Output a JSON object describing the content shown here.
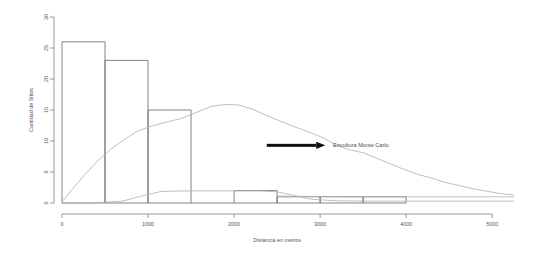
{
  "chart_data": {
    "type": "bar",
    "title": "",
    "subtitle": "",
    "xlabel": "Distancia en metros",
    "ylabel": "Cantidad de Sitios",
    "xlim": [
      0,
      5300
    ],
    "ylim": [
      0,
      30
    ],
    "grid": false,
    "legend_position": "none",
    "x_ticks": [
      0,
      1000,
      2000,
      3000,
      4000,
      5000
    ],
    "x_tick_labels": [
      "0",
      "1000",
      "2000",
      "3000",
      "4000",
      "5000"
    ],
    "y_ticks": [
      0,
      5,
      10,
      15,
      20,
      25,
      30
    ],
    "y_tick_labels": [
      "0",
      "5",
      "10",
      "15",
      "20",
      "25",
      "30"
    ],
    "bin_width": 500,
    "bin_edges": [
      0,
      500,
      1000,
      1500,
      2000,
      2500,
      3000,
      3500,
      4000
    ],
    "categories": [
      "0-500",
      "500-1000",
      "1000-1500",
      "1500-2000",
      "2000-2500",
      "2500-3000",
      "3000-3500",
      "3500-4000"
    ],
    "values": [
      26,
      23,
      15,
      0,
      2,
      1,
      1,
      1
    ],
    "series": [
      {
        "name": "Histograma de sitios",
        "type": "bar",
        "values": [
          26,
          23,
          15,
          0,
          2,
          1,
          1,
          1
        ]
      },
      {
        "name": "Envoltura Monte Carlo superior",
        "type": "line",
        "x": [
          0,
          120,
          260,
          400,
          560,
          720,
          880,
          1040,
          1200,
          1380,
          1560,
          1740,
          1900,
          2060,
          2220,
          2380,
          2540,
          2700,
          2860,
          3020,
          3180,
          3340,
          3500,
          3660,
          3820,
          3980,
          4140,
          4300,
          4460,
          4620,
          4780,
          4940,
          5100,
          5250
        ],
        "values": [
          0.2,
          2.2,
          4.5,
          6.6,
          8.6,
          10.2,
          11.6,
          12.4,
          13.0,
          13.6,
          14.6,
          15.6,
          15.9,
          15.8,
          15.1,
          14.1,
          13.2,
          12.3,
          11.5,
          10.6,
          9.4,
          8.6,
          8.1,
          7.2,
          6.3,
          5.4,
          4.6,
          4.0,
          3.3,
          2.8,
          2.3,
          1.9,
          1.5,
          1.3
        ]
      },
      {
        "name": "Envoltura Monte Carlo inferior",
        "type": "line",
        "x": [
          0,
          400,
          700,
          950,
          1150,
          1400,
          1700,
          2000,
          2300,
          2500,
          2700,
          2900,
          3200,
          3600,
          4000,
          4400,
          4800,
          5250
        ],
        "values": [
          0.0,
          0.05,
          0.3,
          1.2,
          1.85,
          1.95,
          1.95,
          1.95,
          1.95,
          1.8,
          1.2,
          0.6,
          0.35,
          0.3,
          0.3,
          0.3,
          0.3,
          0.3
        ]
      },
      {
        "name": "Linea de referencia",
        "type": "line",
        "x": [
          2500,
          3000,
          3600,
          4200,
          4800,
          5250
        ],
        "values": [
          1.1,
          1.05,
          1.0,
          1.0,
          1.0,
          1.0
        ]
      }
    ],
    "annotations": [
      {
        "text": "Envoltura Monte Carlo",
        "x": 3150,
        "y": 9.3,
        "arrow_from_x": 2380,
        "arrow_from_y": 9.3,
        "arrow_to_x": 3060,
        "arrow_to_y": 9.3
      }
    ],
    "colors": {
      "bar_stroke": "#6e6e6e",
      "bar_fill": "none",
      "envelope": "#b3b3b3",
      "axis": "#8c8c8c",
      "text": "#555555",
      "arrow": "#111111",
      "background": "#ffffff"
    }
  }
}
